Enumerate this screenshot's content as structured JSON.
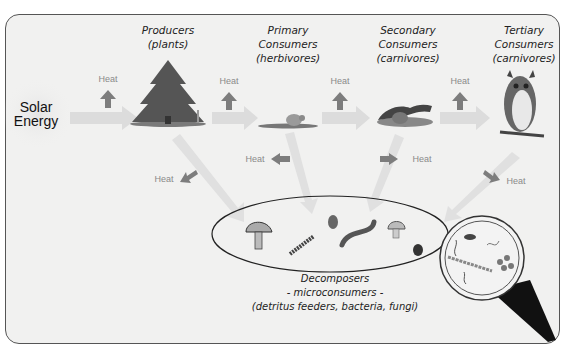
{
  "diagram": {
    "source": {
      "label_line1": "Solar",
      "label_line2": "Energy"
    },
    "levels": [
      {
        "name": "Producers",
        "sub": "(plants)",
        "organism": "tree"
      },
      {
        "name_line1": "Primary",
        "name_line2": "Consumers",
        "sub": "(herbivores)",
        "organism": "mouse"
      },
      {
        "name_line1": "Secondary",
        "name_line2": "Consumers",
        "sub": "(carnivores)",
        "organism": "weasel"
      },
      {
        "name_line1": "Tertiary",
        "name_line2": "Consumers",
        "sub": "(carnivores)",
        "organism": "owl"
      }
    ],
    "heat_label": "Heat",
    "heat_labels": [
      "Heat",
      "Heat",
      "Heat",
      "Heat",
      "Heat",
      "Heat",
      "Heat",
      "Heat"
    ],
    "decomposers": {
      "title": "Decomposers",
      "subtitle": "- microconsumers -",
      "detail": "(detritus feeders, bacteria, fungi)",
      "organisms": [
        "mushroom",
        "millipede",
        "pill-bug",
        "earthworm",
        "small-mushroom",
        "beetle"
      ],
      "magnified": "bacteria"
    },
    "colors": {
      "arrow": "#7d7d7d",
      "flow": "#d9d9d9",
      "background": "#f1f1f0",
      "text": "#222222",
      "heat_text": "#8a8a8a"
    }
  }
}
